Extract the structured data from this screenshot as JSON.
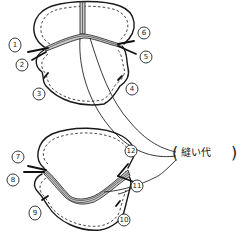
{
  "diagram": {
    "type": "sewing-instruction-sketch",
    "label": "縫い代",
    "label_open": "(",
    "label_close": ")",
    "top_piece": {
      "markers": [
        {
          "id": 1,
          "text": "1"
        },
        {
          "id": 2,
          "text": "2"
        },
        {
          "id": 3,
          "text": "3"
        },
        {
          "id": 4,
          "text": "4"
        },
        {
          "id": 5,
          "text": "5"
        },
        {
          "id": 6,
          "text": "6"
        }
      ]
    },
    "bottom_piece": {
      "markers": [
        {
          "id": 7,
          "text": "7"
        },
        {
          "id": 8,
          "text": "8"
        },
        {
          "id": 9,
          "text": "9"
        },
        {
          "id": 10,
          "text": "10"
        },
        {
          "id": 11,
          "text": "11"
        },
        {
          "id": 12,
          "text": "12"
        }
      ]
    },
    "colors": {
      "ink": "#1a1a1a",
      "seam_allowance": "#c8c8c8",
      "background": "#ffffff"
    }
  }
}
